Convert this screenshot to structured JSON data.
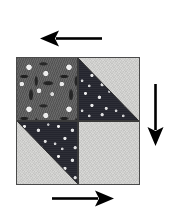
{
  "figure": {
    "name": "quilt-block-rotation-diagram",
    "background_color": "#ffffff",
    "alt_title": "Quilt block with rotation direction arrows"
  },
  "block": {
    "name": "half-square-triangle-quilt-block",
    "border_color": "#4a4a4a",
    "seam_color": "#3a3a3a",
    "x": 16,
    "y": 57,
    "width": 124,
    "height": 128,
    "quadrants": [
      {
        "id": "top-left",
        "label": "Top left",
        "style": "whole-square",
        "fabrics": [
          "floral-print-dark"
        ]
      },
      {
        "id": "top-right",
        "label": "Top right",
        "style": "half-square-triangle",
        "fabrics": [
          "star-print-dark",
          "solid-light"
        ],
        "dark_triangle_position": "lower-left",
        "light_triangle_position": "upper-right"
      },
      {
        "id": "bottom-left",
        "label": "Bottom left",
        "style": "half-square-triangle",
        "fabrics": [
          "solid-light",
          "star-print-dark"
        ],
        "dark_triangle_position": "upper-right",
        "light_triangle_position": "lower-left"
      },
      {
        "id": "bottom-right",
        "label": "Bottom right",
        "style": "whole-square",
        "fabrics": [
          "solid-light"
        ]
      }
    ]
  },
  "fabrics": {
    "floral-print-dark": {
      "label": "Dark floral print",
      "base_color": "#5e5e5e",
      "motif_color": "#f8f8f8"
    },
    "star-print-dark": {
      "label": "Dark star print",
      "base_color": "#262730",
      "motif_color": "#ffffff"
    },
    "solid-light": {
      "label": "Light solid",
      "base_color": "#d5d5d3",
      "motif_color": "#d5d5d3"
    }
  },
  "arrows": [
    {
      "id": "top",
      "name": "arrow-left",
      "direction": "left",
      "color": "#000000",
      "position": "above-block",
      "length": 60
    },
    {
      "id": "right",
      "name": "arrow-down",
      "direction": "down",
      "color": "#000000",
      "position": "right-of-block",
      "length": 60
    },
    {
      "id": "bottom",
      "name": "arrow-right",
      "direction": "right",
      "color": "#000000",
      "position": "below-block",
      "length": 60
    }
  ]
}
